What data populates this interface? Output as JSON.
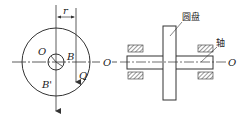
{
  "diagram": {
    "type": "mechanics-figure",
    "left_view": {
      "labels": {
        "r": "r",
        "O_center": "O",
        "B": "B",
        "B_prime": "B'",
        "Q": "Q",
        "O_axis": "O"
      }
    },
    "right_view": {
      "labels": {
        "disc": "圆盘",
        "shaft": "轴",
        "O_axis": "O"
      }
    },
    "colors": {
      "line": "#333333",
      "hatch": "#555555",
      "background": "#ffffff"
    }
  }
}
